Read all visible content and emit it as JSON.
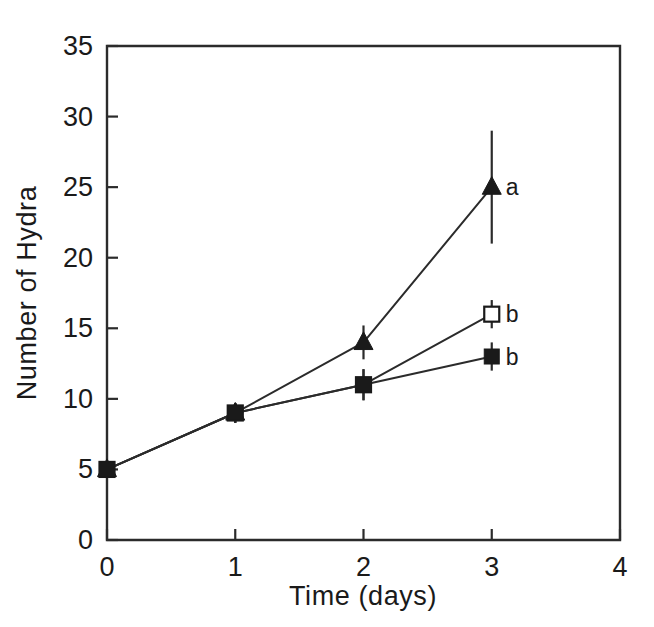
{
  "chart_data": {
    "type": "line",
    "title": "",
    "xlabel": "Time  (days)",
    "ylabel": "Number of Hydra",
    "xlim": [
      0,
      4
    ],
    "ylim": [
      0,
      35
    ],
    "xticks": [
      0,
      1,
      2,
      3,
      4
    ],
    "yticks": [
      0,
      5,
      10,
      15,
      20,
      25,
      30,
      35
    ],
    "xtick_labels": [
      "0",
      "1",
      "2",
      "3",
      "4"
    ],
    "ytick_labels": [
      "0",
      "5",
      "10",
      "15",
      "20",
      "25",
      "30",
      "35"
    ],
    "grid": false,
    "legend": "none",
    "frame": "box",
    "x": [
      0,
      1,
      2,
      3
    ],
    "series": [
      {
        "name": "filled-triangle",
        "marker": "triangle-filled",
        "values": [
          5,
          9,
          14,
          25
        ],
        "errors": [
          0,
          0.7,
          1.2,
          4.0
        ],
        "annotation": "a",
        "annotation_index": 3
      },
      {
        "name": "open-square",
        "marker": "square-open",
        "values": [
          5,
          9,
          11,
          16
        ],
        "errors": [
          0,
          0.7,
          1.1,
          1.0
        ],
        "annotation": "b",
        "annotation_index": 3
      },
      {
        "name": "filled-square",
        "marker": "square-filled",
        "values": [
          5,
          9,
          11,
          13
        ],
        "errors": [
          0,
          0.7,
          1.1,
          1.0
        ],
        "annotation": "b",
        "annotation_index": 3
      }
    ],
    "annotations": [
      {
        "text": "a",
        "x": 3,
        "y": 25
      },
      {
        "text": "b",
        "x": 3,
        "y": 16
      },
      {
        "text": "b",
        "x": 3,
        "y": 13
      }
    ],
    "colors": {
      "axis": "#2b2b2b",
      "line": "#2b2b2b",
      "marker_fill": "#1a1a1a",
      "marker_open_fill": "#ffffff",
      "background": "#ffffff"
    }
  }
}
